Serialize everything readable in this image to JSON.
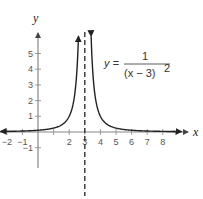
{
  "chart_data": {
    "type": "line",
    "title": "",
    "xlabel": "x",
    "ylabel": "y",
    "equation": {
      "lhs": "y =",
      "numerator": "1",
      "denominator": "(x − 3)",
      "exponent": "2"
    },
    "xlim": [
      -2.4,
      9.5
    ],
    "ylim": [
      -1.8,
      6.2
    ],
    "x_ticks": [
      -2,
      -1,
      1,
      2,
      3,
      4,
      5,
      6,
      7,
      8
    ],
    "x_tick_labels": [
      "−2",
      "−1",
      "",
      "2",
      "3",
      "4",
      "5",
      "6",
      "7",
      "8"
    ],
    "y_ticks": [
      -1,
      1,
      2,
      3,
      4,
      5
    ],
    "y_tick_labels": [
      "−1",
      "1",
      "2",
      "3",
      "4",
      "5"
    ],
    "vertical_asymptote": {
      "x": 3,
      "style": "dashed"
    },
    "horizontal_asymptote": {
      "y": 0
    },
    "series": [
      {
        "name": "y = 1/(x-3)^2",
        "function": "1/(x-3)^2",
        "x": [
          -2.4,
          -2,
          -1,
          0,
          1,
          2,
          2.5,
          2.6
        ],
        "values": [
          0.034,
          0.04,
          0.0625,
          0.111,
          0.25,
          1,
          4,
          6.25
        ]
      },
      {
        "name": "y = 1/(x-3)^2 (right branch)",
        "function": "1/(x-3)^2",
        "x": [
          3.4,
          3.5,
          4,
          5,
          6,
          7,
          8,
          9
        ],
        "values": [
          6.25,
          4,
          1,
          0.25,
          0.111,
          0.0625,
          0.04,
          0.028
        ]
      }
    ],
    "grid": false,
    "legend": null
  }
}
